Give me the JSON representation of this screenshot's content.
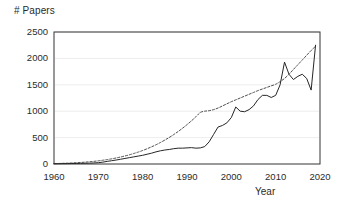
{
  "chart_data": {
    "type": "line",
    "title": "",
    "xlabel": "Year",
    "ylabel": "# Papers",
    "xlim": [
      1960,
      2020
    ],
    "ylim": [
      0,
      2500
    ],
    "xticks": [
      1960,
      1970,
      1980,
      1990,
      2000,
      2010,
      2020
    ],
    "yticks": [
      0,
      500,
      1000,
      1500,
      2000,
      2500
    ],
    "grid": "horizontal",
    "legend": "none",
    "colors": {
      "data_line": "#262626",
      "trend_line": "#3a3a3a",
      "axis": "#333333",
      "grid": "#e8e8e8",
      "background": "#ffffff"
    },
    "x": [
      1960,
      1961,
      1962,
      1963,
      1964,
      1965,
      1966,
      1967,
      1968,
      1969,
      1970,
      1971,
      1972,
      1973,
      1974,
      1975,
      1976,
      1977,
      1978,
      1979,
      1980,
      1981,
      1982,
      1983,
      1984,
      1985,
      1986,
      1987,
      1988,
      1989,
      1990,
      1991,
      1992,
      1993,
      1994,
      1995,
      1996,
      1997,
      1998,
      1999,
      2000,
      2001,
      2002,
      2003,
      2004,
      2005,
      2006,
      2007,
      2008,
      2009,
      2010,
      2011,
      2012,
      2013,
      2014,
      2015,
      2016,
      2017,
      2018,
      2019
    ],
    "series": [
      {
        "name": "Papers per year",
        "style": "solid",
        "values": [
          5,
          6,
          7,
          8,
          9,
          10,
          12,
          14,
          16,
          20,
          25,
          35,
          50,
          62,
          75,
          90,
          105,
          120,
          135,
          150,
          165,
          185,
          205,
          230,
          250,
          265,
          275,
          290,
          300,
          300,
          305,
          310,
          300,
          305,
          330,
          420,
          560,
          700,
          730,
          780,
          880,
          1080,
          1000,
          990,
          1030,
          1100,
          1220,
          1300,
          1300,
          1260,
          1300,
          1500,
          1930,
          1700,
          1600,
          1660,
          1700,
          1620,
          1400,
          2250
        ]
      },
      {
        "name": "Trend (fitted exponential)",
        "style": "dashed",
        "values": [
          8,
          10,
          13,
          16,
          20,
          24,
          29,
          35,
          42,
          50,
          60,
          71,
          84,
          98,
          114,
          132,
          152,
          174,
          199,
          226,
          256,
          289,
          325,
          364,
          407,
          453,
          503,
          557,
          615,
          678,
          745,
          817,
          894,
          976,
          1000,
          1010,
          1030,
          1060,
          1100,
          1140,
          1180,
          1215,
          1250,
          1285,
          1320,
          1355,
          1390,
          1420,
          1450,
          1480,
          1510,
          1560,
          1620,
          1700,
          1790,
          1880,
          1970,
          2060,
          2150,
          2230
        ]
      }
    ],
    "annotations": {
      "peak_year": 2019,
      "peak_value": 2250,
      "local_peak_year": 2012,
      "local_peak_value": 1930
    }
  },
  "labels": {
    "y_axis_title": "# Papers",
    "x_axis_title": "Year"
  }
}
